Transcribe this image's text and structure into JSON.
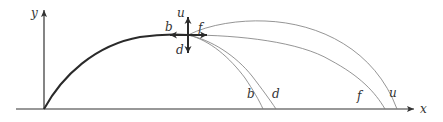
{
  "figure": {
    "axes": {
      "x_label": "x",
      "y_label": "y"
    },
    "launch_point_labels": {
      "up": "u",
      "down": "d",
      "back": "b",
      "forward": "f"
    },
    "landing_labels": {
      "back": "b",
      "down": "d",
      "forward": "f",
      "up": "u"
    },
    "colors": {
      "thick_path": "#2a2a2a",
      "thin_paths": "#7a7a7a",
      "axes": "#333333"
    }
  }
}
